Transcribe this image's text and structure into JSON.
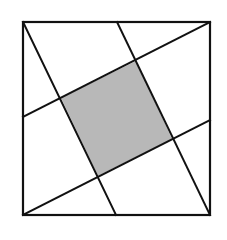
{
  "diagram": {
    "title": "",
    "colors": {
      "background": "#ffffff",
      "stroke": "#111111",
      "shade": "#b8b8b8"
    },
    "outer_square": {
      "x1": 23,
      "y1": 22,
      "x2": 210,
      "y2": 215
    },
    "lines": [
      {
        "name": "line-top-left-to-bottom-mid",
        "x1": 23,
        "y1": 22,
        "x2": 116,
        "y2": 215
      },
      {
        "name": "line-top-mid-to-bottom-right",
        "x1": 117,
        "y1": 22,
        "x2": 210,
        "y2": 215
      },
      {
        "name": "line-left-mid-to-top-right",
        "x1": 23,
        "y1": 117,
        "x2": 210,
        "y2": 22
      },
      {
        "name": "line-bottom-left-to-right-mid",
        "x1": 23,
        "y1": 215,
        "x2": 210,
        "y2": 120
      }
    ],
    "shaded_square": {
      "points": [
        [
          61,
          98
        ],
        [
          136,
          61
        ],
        [
          172,
          139
        ],
        [
          98,
          176
        ]
      ]
    }
  }
}
